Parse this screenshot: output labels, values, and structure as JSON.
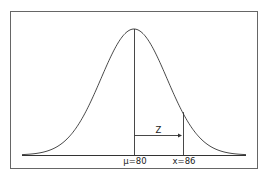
{
  "diagram": {
    "type": "normal-distribution",
    "mean": 80,
    "x_value": 86,
    "labels": {
      "mean_label": "μ=80",
      "x_label": "x=86",
      "z_label": "Z"
    },
    "colors": {
      "line": "#333333",
      "frame": "#555555"
    }
  }
}
